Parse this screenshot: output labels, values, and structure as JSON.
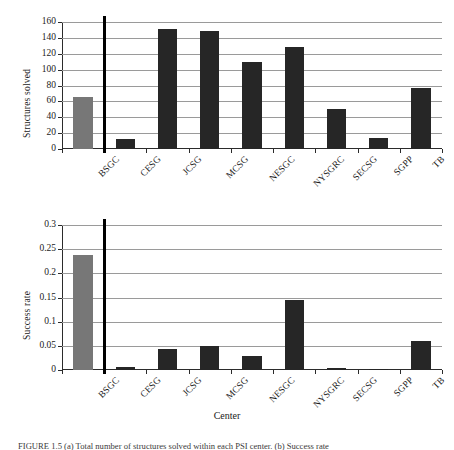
{
  "figure": {
    "caption": "FIGURE 1.5  (a) Total number of structures solved within each PSI center. (b) Success rate"
  },
  "chart_data": [
    {
      "id": "structures-solved",
      "type": "bar",
      "title": "",
      "xlabel": "",
      "ylabel": "Structures solved",
      "categories": [
        "BSGC",
        "CESG",
        "JCSG",
        "MCSG",
        "NESGC",
        "NYSGRC",
        "SECSG",
        "SGPP",
        "TB"
      ],
      "values": [
        65,
        13,
        151,
        149,
        109,
        128,
        50,
        14,
        77
      ],
      "bar_colors": [
        "#777777",
        "#262626",
        "#262626",
        "#262626",
        "#262626",
        "#262626",
        "#262626",
        "#262626",
        "#262626"
      ],
      "ylim": [
        0,
        160
      ],
      "ytick_step": 20,
      "yticks": [
        0,
        20,
        40,
        60,
        80,
        100,
        120,
        140,
        160
      ],
      "ytick_labels": [
        "0",
        "20",
        "40",
        "60",
        "80",
        "100",
        "120",
        "140",
        "160"
      ],
      "grid": true,
      "legend": "none",
      "separator_after_category": "BSGC",
      "separator_color": "#000000"
    },
    {
      "id": "success-rate",
      "type": "bar",
      "title": "",
      "xlabel": "Center",
      "ylabel": "Success rate",
      "categories": [
        "BSGC",
        "CESG",
        "JCSG",
        "MCSG",
        "NESGC",
        "NYSGRC",
        "SECSG",
        "SGPP",
        "TB"
      ],
      "values": [
        0.238,
        0.006,
        0.043,
        0.049,
        0.03,
        0.145,
        0.004,
        0.003,
        0.06
      ],
      "bar_colors": [
        "#777777",
        "#262626",
        "#262626",
        "#262626",
        "#262626",
        "#262626",
        "#262626",
        "#262626",
        "#262626"
      ],
      "ylim": [
        0,
        0.3
      ],
      "ytick_step": 0.05,
      "yticks": [
        0,
        0.05,
        0.1,
        0.15,
        0.2,
        0.25,
        0.3
      ],
      "ytick_labels": [
        "0",
        "0.05",
        "0.1",
        "0.15",
        "0.2",
        "0.25",
        "0.3"
      ],
      "grid": true,
      "legend": "none",
      "separator_after_category": "BSGC",
      "separator_color": "#000000"
    }
  ]
}
